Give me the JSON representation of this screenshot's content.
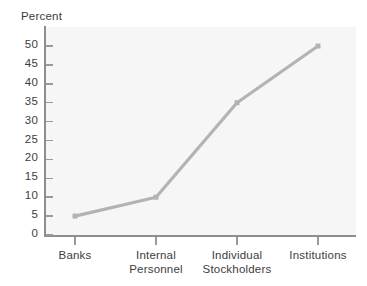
{
  "chart_data": {
    "type": "line",
    "title": "",
    "xlabel": "",
    "ylabel": "Percent",
    "categories": [
      "Banks",
      "Internal Personnel",
      "Individual Stockholders",
      "Institutions"
    ],
    "category_lines": [
      [
        "Banks"
      ],
      [
        "Internal",
        "Personnel"
      ],
      [
        "Individual",
        "Stockholders"
      ],
      [
        "Institutions"
      ]
    ],
    "values": [
      5,
      10,
      35,
      50
    ],
    "series": [
      {
        "name": "Percent",
        "values": [
          5,
          10,
          35,
          50
        ]
      }
    ],
    "ylim": [
      0,
      50
    ],
    "ytick_step": 5,
    "ytick_labels": [
      "0",
      "5",
      "10",
      "15",
      "20",
      "25",
      "30",
      "35",
      "40",
      "45",
      "50"
    ],
    "grid": false,
    "legend": "none",
    "marker": "square",
    "line_color": "#b3b3b3",
    "marker_color": "#b3b3b3",
    "plot_background": "#f6f6f6",
    "axis_color": "#8e8e8e",
    "text_color": "#3d3d3d"
  },
  "axis": {
    "y_title": "Percent"
  }
}
